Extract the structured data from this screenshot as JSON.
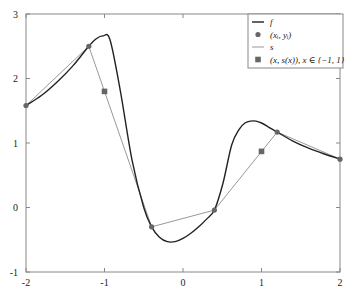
{
  "chart_data": {
    "type": "line",
    "title": "",
    "xlabel": "",
    "ylabel": "",
    "xlim": [
      -2,
      2
    ],
    "ylim": [
      -1,
      3
    ],
    "grid": false,
    "legend_position": "upper right",
    "x_ticks": [
      "-2",
      "-1",
      "0",
      "1",
      "2"
    ],
    "y_ticks": [
      "-1",
      "0",
      "1",
      "2",
      "3"
    ],
    "series": [
      {
        "name": "f",
        "legend_label": "f",
        "style": "line",
        "color": "#222222",
        "x": [
          -2.0,
          -1.8,
          -1.6,
          -1.4,
          -1.2,
          -1.1,
          -1.02,
          -0.93,
          -0.8,
          -0.65,
          -0.5,
          -0.4,
          -0.3,
          -0.2,
          -0.1,
          0.0,
          0.1,
          0.2,
          0.3,
          0.4,
          0.51,
          0.62,
          0.72,
          0.79,
          0.86,
          0.93,
          1.0,
          1.1,
          1.2,
          1.4,
          1.6,
          1.8,
          2.0
        ],
        "y": [
          1.58,
          1.74,
          1.95,
          2.2,
          2.5,
          2.62,
          2.66,
          2.6,
          1.82,
          0.74,
          0.0,
          -0.3,
          -0.46,
          -0.53,
          -0.53,
          -0.48,
          -0.4,
          -0.3,
          -0.18,
          -0.04,
          0.38,
          0.97,
          1.22,
          1.31,
          1.34,
          1.34,
          1.31,
          1.24,
          1.17,
          1.03,
          0.92,
          0.83,
          0.75
        ]
      },
      {
        "name": "(x_i, y_i)",
        "legend_label": "(xᵢ, yᵢ)",
        "style": "marker-circle",
        "color": "#666666",
        "x": [
          -2.0,
          -1.2,
          -0.4,
          0.4,
          1.2,
          2.0
        ],
        "y": [
          1.58,
          2.5,
          -0.3,
          -0.04,
          1.17,
          0.75
        ]
      },
      {
        "name": "s",
        "legend_label": "s",
        "style": "line",
        "color": "#999999",
        "x": [
          -2.0,
          -1.2,
          -0.4,
          0.4,
          1.2,
          2.0
        ],
        "y": [
          1.58,
          2.5,
          -0.3,
          -0.04,
          1.17,
          0.75
        ]
      },
      {
        "name": "(x, s(x)), x ∈ {-1, 1}",
        "legend_label": "(x, s(x)), x ∈ {−1, 1}",
        "style": "marker-square",
        "color": "#666666",
        "x": [
          -1.0,
          1.0
        ],
        "y": [
          1.8,
          0.87
        ]
      }
    ]
  }
}
